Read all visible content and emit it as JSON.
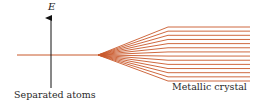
{
  "diagram": {
    "axis_label": "E",
    "left_label": "Separated atoms",
    "right_label": "Metallic crystal",
    "line_color": "#c8582a",
    "axis_color": "#111111",
    "level_count": 14,
    "apex": {
      "x": 98,
      "y": 55
    },
    "fan_end_x": 168,
    "lines_end_x": 250,
    "top_y": 27,
    "bottom_y": 81
  }
}
